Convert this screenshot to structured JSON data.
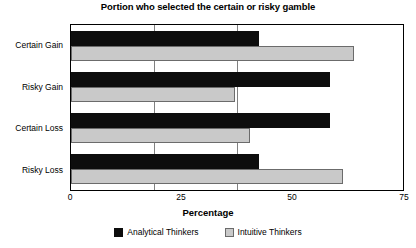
{
  "chart_data": {
    "type": "bar",
    "orientation": "horizontal",
    "title": "Portion who selected the certain or risky gamble",
    "xlabel": "Percentage",
    "ylabel": "",
    "xlim": [
      0,
      75
    ],
    "xticks": [
      0,
      25,
      50,
      75
    ],
    "xtick_labels": [
      "0",
      "25",
      "50",
      "75"
    ],
    "grid": true,
    "grid_axis": "x",
    "legend_position": "bottom",
    "categories": [
      "Certain Gain",
      "Risky Gain",
      "Certain Loss",
      "Risky Loss"
    ],
    "series": [
      {
        "name": "Analytical Thinkers",
        "color": "#0d0d0d",
        "values": [
          42.5,
          58.5,
          58.5,
          42.5
        ]
      },
      {
        "name": "Intuitive Thinkers",
        "color": "#c9c9c9",
        "values": [
          64.0,
          37.0,
          40.5,
          61.5
        ]
      }
    ]
  },
  "legend": {
    "items": [
      {
        "label": "Analytical Thinkers"
      },
      {
        "label": "Intuitive Thinkers"
      }
    ]
  }
}
